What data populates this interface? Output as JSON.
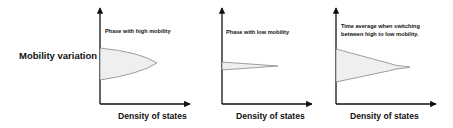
{
  "y_axis_label": "Mobility variation",
  "panels": [
    {
      "title": "Phase with high mobility",
      "x_axis_label": "Density of states",
      "shape": "wide-lens"
    },
    {
      "title": "Phase with low mobility",
      "x_axis_label": "Density of states",
      "shape": "narrow-wedge"
    },
    {
      "title_line1": "Time average when switching",
      "title_line2": "between high to low mobility.",
      "x_axis_label": "Density of states",
      "shape": "wide-tapered-tail"
    }
  ],
  "colors": {
    "axis": "#111111",
    "shape_fill": "#efefef",
    "shape_stroke": "#777777"
  }
}
